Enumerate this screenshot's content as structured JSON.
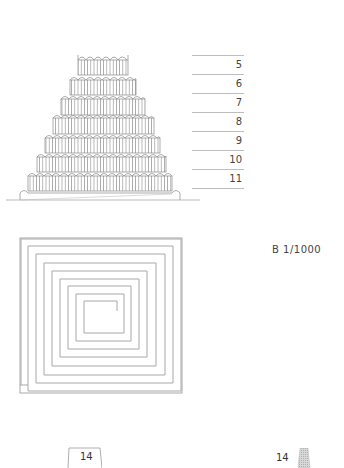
{
  "figure": {
    "type": "architectural-drawing",
    "elevation": {
      "tiers": 7,
      "level_labels": [
        "5",
        "6",
        "7",
        "8",
        "9",
        "10",
        "11"
      ]
    },
    "plan": {
      "scale_label": "B  1/1000"
    }
  },
  "footer": {
    "left_tab_label": "14",
    "right_page_label": "14"
  },
  "colors": {
    "line": "#9e9e9e",
    "text": "#444444",
    "swatch": "#c8c8c8"
  }
}
